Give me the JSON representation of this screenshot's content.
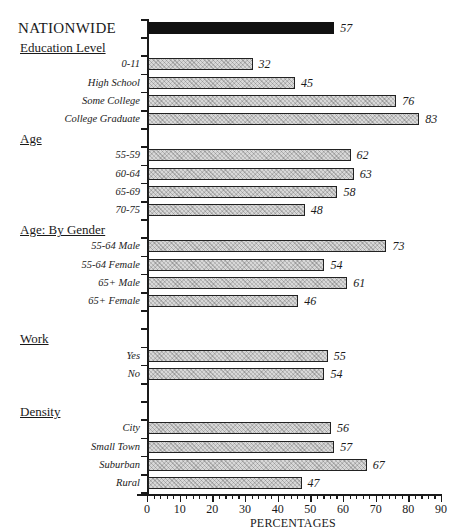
{
  "chart_data": {
    "type": "bar",
    "orientation": "horizontal",
    "title": "",
    "xlabel": "PERCENTAGES",
    "ylabel": "",
    "xlim": [
      0,
      90
    ],
    "xticks": [
      0,
      10,
      20,
      30,
      40,
      50,
      60,
      70,
      80,
      90
    ],
    "grid": false,
    "legend": null,
    "rows": [
      {
        "kind": "bar",
        "label": "NATIONWIDE",
        "value": 57,
        "style": "solid",
        "headline": true
      },
      {
        "kind": "group",
        "label": "Education Level"
      },
      {
        "kind": "bar",
        "label": "0-11",
        "value": 32
      },
      {
        "kind": "bar",
        "label": "High School",
        "value": 45
      },
      {
        "kind": "bar",
        "label": "Some College",
        "value": 76
      },
      {
        "kind": "bar",
        "label": "College Graduate",
        "value": 83
      },
      {
        "kind": "group",
        "label": "Age"
      },
      {
        "kind": "bar",
        "label": "55-59",
        "value": 62
      },
      {
        "kind": "bar",
        "label": "60-64",
        "value": 63
      },
      {
        "kind": "bar",
        "label": "65-69",
        "value": 58
      },
      {
        "kind": "bar",
        "label": "70-75",
        "value": 48
      },
      {
        "kind": "group",
        "label": "Age:  By Gender"
      },
      {
        "kind": "bar",
        "label": "55-64 Male",
        "value": 73
      },
      {
        "kind": "bar",
        "label": "55-64 Female",
        "value": 54
      },
      {
        "kind": "bar",
        "label": "65+ Male",
        "value": 61
      },
      {
        "kind": "bar",
        "label": "65+ Female",
        "value": 46
      },
      {
        "kind": "spacer"
      },
      {
        "kind": "group",
        "label": "Work"
      },
      {
        "kind": "bar",
        "label": "Yes",
        "value": 55
      },
      {
        "kind": "bar",
        "label": "No",
        "value": 54
      },
      {
        "kind": "spacer"
      },
      {
        "kind": "group",
        "label": "Density"
      },
      {
        "kind": "bar",
        "label": "City",
        "value": 56
      },
      {
        "kind": "bar",
        "label": "Small Town",
        "value": 57
      },
      {
        "kind": "bar",
        "label": "Suburban",
        "value": 67
      },
      {
        "kind": "bar",
        "label": "Rural",
        "value": 47
      }
    ]
  },
  "colors": {
    "headline_bar": "#111111",
    "pattern_bar": "#d8d8d8",
    "border": "#222222"
  }
}
